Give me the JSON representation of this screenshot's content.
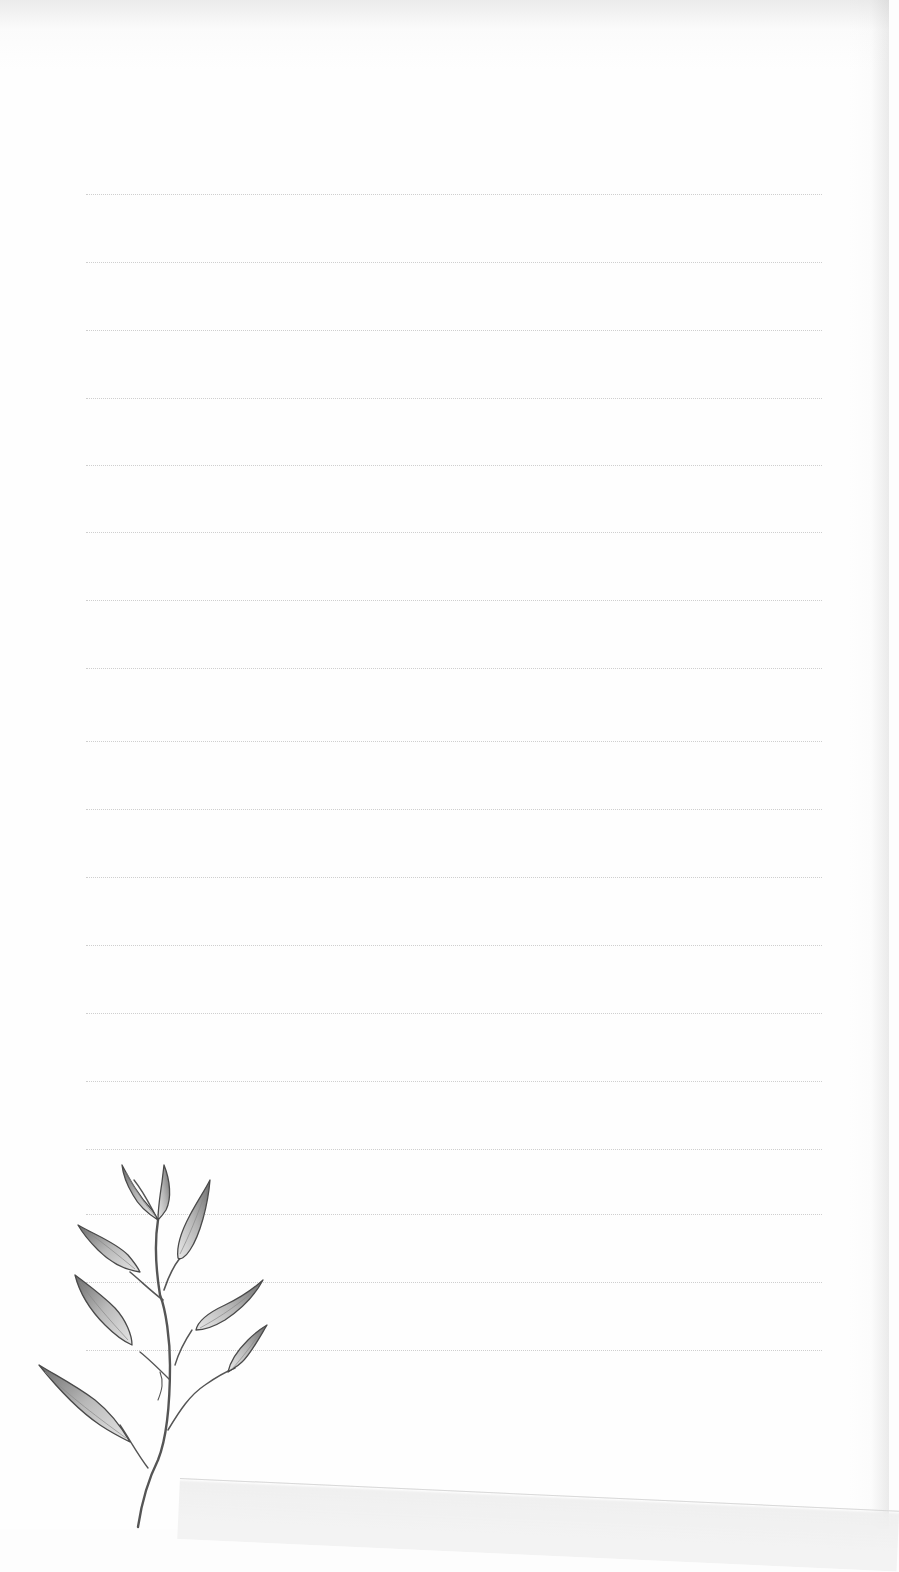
{
  "page": {
    "type": "lined-notepaper",
    "background_color": "#fefefe",
    "line_color": "#cfcfcf",
    "line_count": 18,
    "line_left": 86,
    "line_right": 822,
    "line_positions_y": [
      194,
      262,
      330,
      398,
      465,
      532,
      600,
      668,
      741,
      809,
      877,
      945,
      1013,
      1081,
      1149,
      1214,
      1282,
      1350
    ]
  },
  "illustration": {
    "subject": "pencil-sketch-leafy-branch",
    "position": "bottom-left",
    "stroke_color": "#555555",
    "shade_color": "#9a9a9a"
  }
}
